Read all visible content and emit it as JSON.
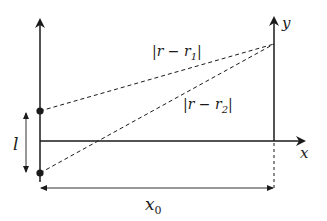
{
  "diagram": {
    "type": "physics-geometry",
    "colors": {
      "stroke": "#1a1a1a",
      "background": "#ffffff"
    },
    "labels": {
      "y_axis": "y",
      "x_axis": "x",
      "dist1_prefix": "|r − r",
      "dist1_sub": "1",
      "dist1_suffix": "|",
      "dist2_prefix": "|r − r",
      "dist2_sub": "2",
      "dist2_suffix": "|",
      "separation": "l",
      "distance_x": "x",
      "distance_x_sub": "0"
    },
    "points": {
      "charge_1": {
        "name": "r1",
        "x": 40,
        "y": 111
      },
      "charge_2": {
        "name": "r2",
        "x": 40,
        "y": 173
      },
      "field_point": {
        "name": "r",
        "x": 274,
        "y": 44
      }
    }
  }
}
